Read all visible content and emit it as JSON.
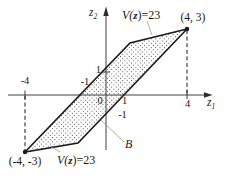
{
  "diagram": {
    "type": "math-figure",
    "description_labels": {
      "axis": {
        "x_var": "z",
        "x_sub": "1",
        "y_var": "z",
        "y_sub": "2"
      },
      "ticks": {
        "x_neg4": "-4",
        "x_neg1": "-1",
        "x_pos1": "1",
        "x_pos4": "4",
        "y_pos1": "1",
        "y_neg1": "-1",
        "origin": "0"
      },
      "vertices": {
        "top_right": "(4, 3)",
        "bottom_left": "(-4, -3)"
      },
      "contour_top": {
        "pre": "V(",
        "vec": "z",
        "post": ")=23"
      },
      "contour_bottom": {
        "pre": "V(",
        "vec": "z",
        "post": ")=23"
      },
      "region_label": "B"
    },
    "colors": {
      "ink": "#1a1a1a",
      "axis": "#2b2b2b",
      "dot_fill": "#4a4a4a",
      "leader": "#8a8a8a",
      "background": "#ffffff"
    }
  }
}
